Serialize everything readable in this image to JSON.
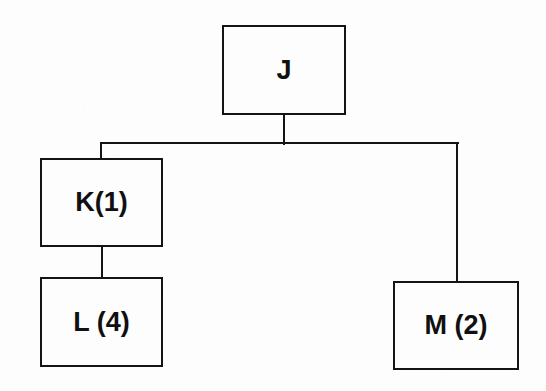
{
  "diagram": {
    "type": "tree",
    "background_color": "#fdfdfd",
    "line_color": "#141414",
    "text_color": "#101010",
    "nodes": [
      {
        "id": "J",
        "label": "J",
        "x": 222,
        "y": 25,
        "width": 124,
        "height": 90,
        "level": 0
      },
      {
        "id": "K",
        "label": "K(1)",
        "x": 40,
        "y": 158,
        "width": 123,
        "height": 89,
        "level": 1
      },
      {
        "id": "M",
        "label": "M (2)",
        "x": 393,
        "y": 281,
        "width": 126,
        "height": 89,
        "level": 1
      },
      {
        "id": "L",
        "label": "L (4)",
        "x": 40,
        "y": 277,
        "width": 123,
        "height": 90,
        "level": 2
      }
    ],
    "edges": [
      {
        "id": "J-bus",
        "from": "J",
        "to": "bus"
      },
      {
        "id": "bus-K",
        "from": "bus",
        "to": "K"
      },
      {
        "id": "bus-M",
        "from": "bus",
        "to": "M"
      },
      {
        "id": "K-L",
        "from": "K",
        "to": "L"
      }
    ],
    "connectors": {
      "j_stem": {
        "x": 283,
        "y": 113,
        "height": 32
      },
      "bus": {
        "x": 100,
        "y": 142,
        "width": 359
      },
      "k_stem": {
        "x": 100,
        "y": 142,
        "height": 18
      },
      "m_stem": {
        "x": 456,
        "y": 142,
        "height": 141
      },
      "kl_stem": {
        "x": 101,
        "y": 245,
        "height": 34
      }
    }
  }
}
